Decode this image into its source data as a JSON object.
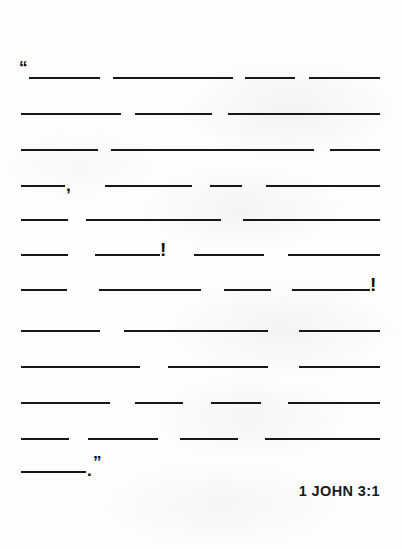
{
  "document": {
    "type": "fill-in-the-blank scripture memory worksheet",
    "background_color": "#fdfdfc",
    "ink_color": "#17171a"
  },
  "citation": {
    "text": "1 JOHN 3:1"
  },
  "punctuation": {
    "open_quote": "“",
    "close_quote": "”",
    "comma": ",",
    "period": ".",
    "exclamation": "!"
  },
  "verse": {
    "lines": [
      {
        "index": 1,
        "blanks": [
          {
            "x": 29,
            "width": 71
          },
          {
            "x": 113,
            "width": 120
          },
          {
            "x": 245,
            "width": 50
          },
          {
            "x": 309,
            "width": 71
          }
        ],
        "marks": [
          {
            "kind": "open_quote",
            "x": 19,
            "class": "quote-open"
          }
        ]
      },
      {
        "index": 2,
        "blanks": [
          {
            "x": 21,
            "width": 100
          },
          {
            "x": 135,
            "width": 77
          },
          {
            "x": 228,
            "width": 152
          }
        ],
        "marks": []
      },
      {
        "index": 3,
        "blanks": [
          {
            "x": 21,
            "width": 77
          },
          {
            "x": 111,
            "width": 203
          },
          {
            "x": 330,
            "width": 50
          }
        ],
        "marks": []
      },
      {
        "index": 4,
        "blanks": [
          {
            "x": 21,
            "width": 44
          },
          {
            "x": 105,
            "width": 87
          },
          {
            "x": 210,
            "width": 32
          },
          {
            "x": 266,
            "width": 114
          }
        ],
        "marks": [
          {
            "kind": "comma",
            "x": 66,
            "class": "comma"
          }
        ]
      },
      {
        "index": 5,
        "blanks": [
          {
            "x": 21,
            "width": 47
          },
          {
            "x": 86,
            "width": 135
          },
          {
            "x": 243,
            "width": 137
          }
        ],
        "marks": []
      },
      {
        "index": 6,
        "blanks": [
          {
            "x": 21,
            "width": 47
          },
          {
            "x": 95,
            "width": 65
          },
          {
            "x": 194,
            "width": 70
          },
          {
            "x": 288,
            "width": 92
          }
        ],
        "marks": [
          {
            "kind": "exclamation",
            "x": 160,
            "class": "bang"
          }
        ]
      },
      {
        "index": 7,
        "blanks": [
          {
            "x": 21,
            "width": 46
          },
          {
            "x": 99,
            "width": 102
          },
          {
            "x": 224,
            "width": 47
          },
          {
            "x": 292,
            "width": 78
          }
        ],
        "marks": [
          {
            "kind": "exclamation",
            "x": 370,
            "class": "bang"
          }
        ]
      },
      {
        "index": 8,
        "blanks": [
          {
            "x": 21,
            "width": 79
          },
          {
            "x": 124,
            "width": 144
          },
          {
            "x": 299,
            "width": 81
          }
        ],
        "marks": []
      },
      {
        "index": 9,
        "blanks": [
          {
            "x": 21,
            "width": 119
          },
          {
            "x": 168,
            "width": 100
          },
          {
            "x": 299,
            "width": 81
          }
        ],
        "marks": []
      },
      {
        "index": 10,
        "blanks": [
          {
            "x": 21,
            "width": 89
          },
          {
            "x": 135,
            "width": 48
          },
          {
            "x": 211,
            "width": 50
          },
          {
            "x": 288,
            "width": 92
          }
        ],
        "marks": []
      },
      {
        "index": 11,
        "blanks": [
          {
            "x": 21,
            "width": 48
          },
          {
            "x": 88,
            "width": 70
          },
          {
            "x": 180,
            "width": 58
          },
          {
            "x": 265,
            "width": 115
          }
        ],
        "marks": []
      },
      {
        "index": 12,
        "blanks": [
          {
            "x": 21,
            "width": 65
          }
        ],
        "marks": [
          {
            "kind": "period",
            "x": 87,
            "class": "period"
          },
          {
            "kind": "close_quote",
            "x": 93,
            "class": "quote-close"
          }
        ]
      }
    ],
    "line_tops": [
      64,
      100,
      136,
      172,
      206,
      241,
      276,
      317,
      353,
      389,
      425,
      458
    ]
  }
}
